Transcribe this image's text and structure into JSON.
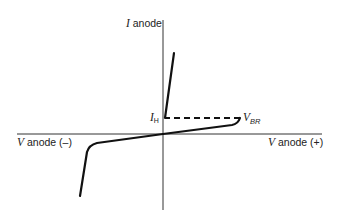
{
  "diagram": {
    "type": "characteristic-curve",
    "axes": {
      "y_label": {
        "symbol": "I",
        "text": "anode"
      },
      "x_negative_label": {
        "symbol": "V",
        "text": "anode (–)"
      },
      "x_positive_label": {
        "symbol": "V",
        "text": "anode (+)"
      }
    },
    "annotations": {
      "holding_current": {
        "symbol": "I",
        "subscript": "H"
      },
      "breakover_voltage": {
        "symbol": "V",
        "subscript": "BR"
      }
    },
    "colors": {
      "curve": "#111111",
      "axis": "#333333",
      "background": "#ffffff"
    }
  }
}
